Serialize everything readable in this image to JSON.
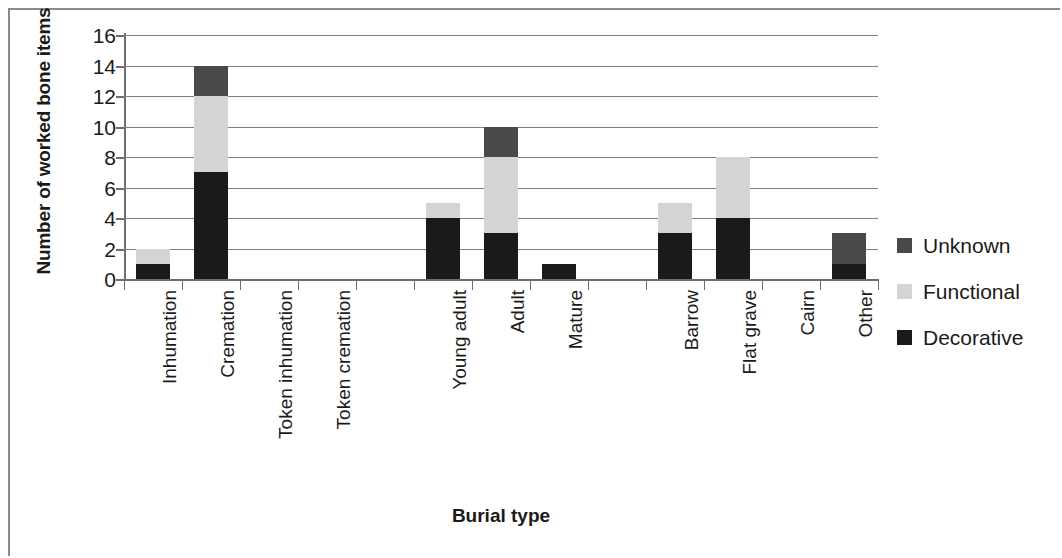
{
  "chart_data": {
    "type": "bar",
    "subtype": "stacked-bar",
    "title": "",
    "xlabel": "Burial type",
    "ylabel": "Number of worked bone items",
    "ylim": [
      0,
      16
    ],
    "y_ticks": [
      0,
      2,
      4,
      6,
      8,
      10,
      12,
      14,
      16
    ],
    "grid": true,
    "legend_position": "right",
    "categories": [
      "Inhumation",
      "Cremation",
      "Token inhumation",
      "Token cremation",
      "",
      "Young adult",
      "Adult",
      "Mature",
      "",
      "Barrow",
      "Flat grave",
      "Cairn",
      "Other"
    ],
    "series": [
      {
        "name": "Decorative",
        "color": "#1a1a1a",
        "values": [
          1,
          7,
          0,
          0,
          0,
          4,
          3,
          1,
          0,
          3,
          4,
          0,
          1
        ]
      },
      {
        "name": "Functional",
        "color": "#d4d4d4",
        "values": [
          1,
          5,
          0,
          0,
          0,
          1,
          5,
          0,
          0,
          2,
          4,
          0,
          0
        ]
      },
      {
        "name": "Unknown",
        "color": "#494949",
        "values": [
          0,
          2,
          0,
          0,
          0,
          0,
          2,
          0,
          0,
          0,
          0,
          0,
          2
        ]
      }
    ],
    "totals": [
      2,
      14,
      0,
      0,
      0,
      5,
      10,
      1,
      0,
      5,
      8,
      0,
      3
    ],
    "legend": [
      {
        "label": "Unknown",
        "color": "#494949"
      },
      {
        "label": "Functional",
        "color": "#d4d4d4"
      },
      {
        "label": "Decorative",
        "color": "#1a1a1a"
      }
    ]
  }
}
